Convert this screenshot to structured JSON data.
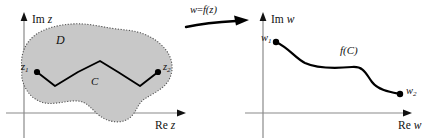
{
  "figure": {
    "background_color": "#ffffff",
    "region_fill_color": "#c8c8c8",
    "region_border_color": "#555555",
    "axis_color": "#808080",
    "curve_color": "#000000",
    "width": 442,
    "height": 139
  },
  "left_panel": {
    "name": "z-plane",
    "axes": {
      "imaginary_label_roman": "Im",
      "imaginary_label_italic": "z",
      "real_label_roman": "Re",
      "real_label_italic": "z"
    },
    "region": {
      "label": "D",
      "description": "shaded blob-shaped domain with dotted boundary"
    },
    "curve": {
      "label": "C",
      "description": "zigzag polyline from z1 to z2"
    },
    "points": [
      {
        "name": "z1",
        "base": "z",
        "subscript": "1"
      },
      {
        "name": "z2",
        "base": "z",
        "subscript": "2"
      }
    ]
  },
  "mapping_arrow": {
    "label_italic": "w",
    "label_equals": "=",
    "label_function": "f(z)",
    "full_label": "w = f(z)",
    "direction": "left-to-right"
  },
  "right_panel": {
    "name": "w-plane",
    "axes": {
      "imaginary_label_roman": "Im",
      "imaginary_label_italic": "w",
      "real_label_roman": "Re",
      "real_label_italic": "w"
    },
    "curve": {
      "label": "f(C)",
      "description": "smooth S-shaped image curve from w1 to w2"
    },
    "points": [
      {
        "name": "w1",
        "base": "w",
        "subscript": "1"
      },
      {
        "name": "w2",
        "base": "w",
        "subscript": "2"
      }
    ]
  }
}
